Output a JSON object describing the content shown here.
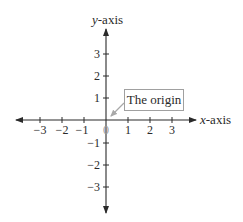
{
  "diagram": {
    "type": "cartesian-coordinate-axes",
    "x_axis": {
      "var": "x",
      "suffix": "-axis",
      "ticks": [
        {
          "value": -3,
          "label": "−3"
        },
        {
          "value": -2,
          "label": "−2"
        },
        {
          "value": -1,
          "label": "−1"
        },
        {
          "value": 1,
          "label": "1"
        },
        {
          "value": 2,
          "label": "2"
        },
        {
          "value": 3,
          "label": "3"
        }
      ]
    },
    "y_axis": {
      "var": "y",
      "suffix": "-axis",
      "ticks": [
        {
          "value": 3,
          "label": "3"
        },
        {
          "value": 2,
          "label": "2"
        },
        {
          "value": 1,
          "label": "1"
        },
        {
          "value": -1,
          "label": "−1"
        },
        {
          "value": -2,
          "label": "−2"
        },
        {
          "value": -3,
          "label": "−3"
        }
      ]
    },
    "origin_label": "0",
    "callout": {
      "text": "The origin"
    },
    "colors": {
      "axis": "#2a2a2a",
      "callout_border": "#a0a0a0",
      "callout_arrow": "#a8a8a8",
      "origin_label": "#9a9a9a"
    }
  }
}
